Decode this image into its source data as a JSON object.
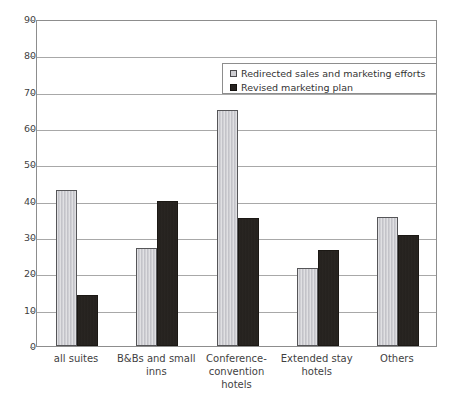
{
  "chart_data": {
    "type": "bar",
    "title": "",
    "xlabel": "",
    "ylabel": "",
    "ylim": [
      0,
      90
    ],
    "yticks": [
      0,
      10,
      20,
      30,
      40,
      50,
      60,
      70,
      80,
      90
    ],
    "grid": true,
    "legend_position": "top-right",
    "categories": [
      "all suites",
      "B&Bs and small inns",
      "Conference-convention hotels",
      "Extended stay hotels",
      "Others"
    ],
    "series": [
      {
        "name": "Redirected sales and marketing efforts",
        "color": "#c9c9ce",
        "values": [
          43,
          27,
          65,
          21.5,
          35.5
        ]
      },
      {
        "name": "Revised marketing plan",
        "color": "#282420",
        "values": [
          14,
          40,
          35.2,
          26.4,
          30.5
        ]
      }
    ]
  },
  "axis": {
    "y_tick_labels": [
      "90",
      "80",
      "70",
      "60",
      "50",
      "40",
      "30",
      "20",
      "10",
      "0"
    ]
  },
  "x_category_lines": [
    [
      "all suites"
    ],
    [
      "B&Bs and small",
      "inns"
    ],
    [
      "Conference-",
      "convention",
      "hotels"
    ],
    [
      "Extended stay",
      "hotels"
    ],
    [
      "Others"
    ]
  ],
  "legend": {
    "items": [
      {
        "label": "Redirected sales and marketing efforts",
        "swatch": "light"
      },
      {
        "label": "Revised marketing plan",
        "swatch": "dark"
      }
    ]
  }
}
